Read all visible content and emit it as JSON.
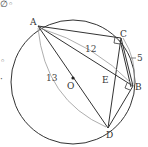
{
  "diagram": {
    "type": "geometry-circle",
    "circle": {
      "cx": 73,
      "cy": 82,
      "r": 62
    },
    "points": {
      "A": {
        "label": "A",
        "x": 38,
        "y": 26
      },
      "B": {
        "label": "B",
        "x": 133,
        "y": 86
      },
      "C": {
        "label": "C",
        "x": 121,
        "y": 38
      },
      "D": {
        "label": "D",
        "x": 108,
        "y": 128
      },
      "O": {
        "label": "O",
        "x": 72,
        "y": 78
      },
      "E": {
        "label": "E",
        "x": 109,
        "y": 78
      }
    },
    "measurements": {
      "AC_label": "12",
      "CB_label": "5",
      "AD_label": "13"
    },
    "marks": {
      "top_left_fragment": "∅◦",
      "left_small_1": "◦",
      "left_small_2": "·"
    },
    "colors": {
      "line": "#333333",
      "arc": "#888888"
    }
  }
}
